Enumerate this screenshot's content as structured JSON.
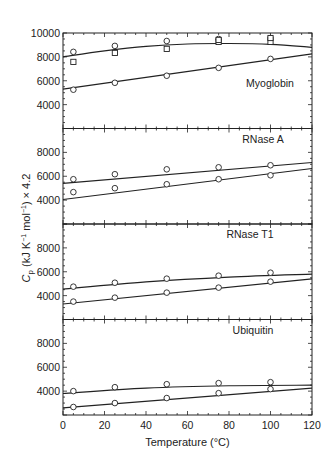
{
  "chart_data": {
    "type": "scatter",
    "layout": "4 vertically stacked panels sharing x-axis",
    "xlabel": "Temperature (°C)",
    "ylabel": "Cp (kJ K⁻¹ mol⁻¹) × 4.2",
    "ylabel_parts": {
      "symbol": "C",
      "subscript": "p",
      "rest": " (kJ K",
      "sup1": "−1",
      "mid": " mol",
      "sup2": "−1",
      "end": ") × 4.2"
    },
    "xlim": [
      0,
      120
    ],
    "x_ticks": [
      0,
      20,
      40,
      60,
      80,
      100,
      120
    ],
    "grid": false,
    "colors": {
      "ink": "#222222",
      "background": "#ffffff"
    },
    "panels": [
      {
        "label": "Myoglobin",
        "ylim": [
          2000,
          10000
        ],
        "y_ticks": [
          4000,
          6000,
          8000,
          10000
        ],
        "series": [
          {
            "name": "upper (circles)",
            "marker": "circle",
            "x": [
              5,
              25,
              50,
              75,
              100
            ],
            "y": [
              8420,
              8920,
              9330,
              9500,
              9580
            ]
          },
          {
            "name": "upper (squares)",
            "marker": "square",
            "x": [
              5,
              25,
              50,
              75,
              75,
              100,
              100
            ],
            "y": [
              7580,
              8330,
              8670,
              9250,
              9420,
              9250,
              9580
            ]
          },
          {
            "name": "lower (circles)",
            "marker": "circle",
            "x": [
              5,
              25,
              50,
              75,
              100
            ],
            "y": [
              5250,
              5830,
              6420,
              7080,
              7830
            ]
          }
        ],
        "fits": [
          {
            "x": [
              0,
              20,
              40,
              60,
              80,
              100,
              120
            ],
            "y": [
              8000,
              8500,
              8880,
              9080,
              9120,
              9050,
              8800
            ]
          },
          {
            "x": [
              0,
              120
            ],
            "y": [
              5300,
              8250
            ]
          }
        ]
      },
      {
        "label": "RNase A",
        "ylim": [
          2000,
          10000
        ],
        "y_ticks": [
          4000,
          6000,
          8000
        ],
        "series": [
          {
            "name": "upper (circles)",
            "marker": "circle",
            "x": [
              5,
              25,
              50,
              75,
              100
            ],
            "y": [
              5750,
              6170,
              6580,
              6750,
              6920
            ]
          },
          {
            "name": "lower (circles)",
            "marker": "circle",
            "x": [
              5,
              25,
              50,
              75,
              100
            ],
            "y": [
              4670,
              5000,
              5330,
              5750,
              6080
            ]
          }
        ],
        "fits": [
          {
            "x": [
              0,
              120
            ],
            "y": [
              5400,
              7150
            ]
          },
          {
            "x": [
              0,
              120
            ],
            "y": [
              4050,
              6650
            ]
          }
        ]
      },
      {
        "label": "RNase T1",
        "ylim": [
          2000,
          10000
        ],
        "y_ticks": [
          4000,
          6000,
          8000
        ],
        "series": [
          {
            "name": "upper (circles)",
            "marker": "circle",
            "x": [
              5,
              25,
              50,
              75,
              100
            ],
            "y": [
              4750,
              5080,
              5420,
              5670,
              5920
            ]
          },
          {
            "name": "lower (circles)",
            "marker": "circle",
            "x": [
              5,
              25,
              50,
              75,
              100
            ],
            "y": [
              3500,
              3830,
              4250,
              4670,
              5170
            ]
          }
        ],
        "fits": [
          {
            "x": [
              0,
              40,
              80,
              120
            ],
            "y": [
              4550,
              5150,
              5550,
              5800
            ]
          },
          {
            "x": [
              0,
              120
            ],
            "y": [
              3300,
              5400
            ]
          }
        ]
      },
      {
        "label": "Ubiquitin",
        "ylim": [
          2000,
          10000
        ],
        "y_ticks": [
          4000,
          6000,
          8000
        ],
        "series": [
          {
            "name": "upper (circles)",
            "marker": "circle",
            "x": [
              5,
              25,
              50,
              75,
              100
            ],
            "y": [
              4000,
              4330,
              4580,
              4670,
              4750
            ]
          },
          {
            "name": "lower (circles)",
            "marker": "circle",
            "x": [
              5,
              25,
              50,
              75,
              100
            ],
            "y": [
              2670,
              3000,
              3420,
              3830,
              4170
            ]
          }
        ],
        "fits": [
          {
            "x": [
              0,
              40,
              80,
              120
            ],
            "y": [
              3800,
              4250,
              4450,
              4500
            ]
          },
          {
            "x": [
              0,
              120
            ],
            "y": [
              2600,
              4250
            ]
          }
        ]
      }
    ]
  }
}
